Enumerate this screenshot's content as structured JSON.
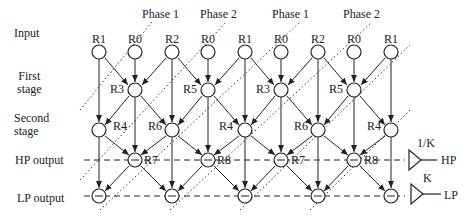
{
  "row_labels": {
    "input": "Input",
    "first_stage_1": "First",
    "first_stage_2": "stage",
    "second_stage_1": "Second",
    "second_stage_2": "stage",
    "hp_output": "HP output",
    "lp_output": "LP output"
  },
  "phases": [
    "Phase 1",
    "Phase 2",
    "Phase 1",
    "Phase 2"
  ],
  "input_nodes": [
    "R1",
    "R0",
    "R2",
    "R0",
    "R1",
    "R0",
    "R2",
    "R0",
    "R1"
  ],
  "first_stage_nodes": [
    "R3",
    "R5",
    "R3",
    "R5"
  ],
  "second_stage_nodes": [
    "R4",
    "R6",
    "R4",
    "R6",
    "R4"
  ],
  "hp_nodes": [
    "R7",
    "R8",
    "R7",
    "R8"
  ],
  "outputs": {
    "hp_gain": "1/K",
    "hp_label": "HP",
    "lp_gain": "K",
    "lp_label": "LP"
  }
}
